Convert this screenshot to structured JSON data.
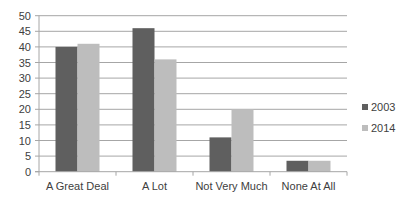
{
  "chart_data": {
    "type": "bar",
    "title": "",
    "xlabel": "",
    "ylabel": "",
    "categories": [
      "A Great Deal",
      "A Lot",
      "Not Very Much",
      "None At All"
    ],
    "series": [
      {
        "name": "2003",
        "color": "#5f5f5f",
        "values": [
          40,
          46,
          11,
          3.5
        ]
      },
      {
        "name": "2014",
        "color": "#bdbdbd",
        "values": [
          41,
          36,
          20,
          3.5
        ]
      }
    ],
    "ylim": [
      0,
      50
    ],
    "yticks": [
      0,
      5,
      10,
      15,
      20,
      25,
      30,
      35,
      40,
      45,
      50
    ],
    "grid": true,
    "legend_position": "right"
  },
  "legend": {
    "items": [
      {
        "label": "2003",
        "color": "#5f5f5f"
      },
      {
        "label": "2014",
        "color": "#bdbdbd"
      }
    ]
  }
}
